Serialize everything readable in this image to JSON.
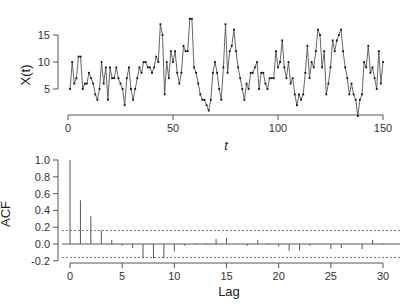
{
  "chart_data": [
    {
      "type": "line",
      "title": "",
      "xlabel": "t",
      "ylabel": "X(t)",
      "xlim": [
        0,
        150
      ],
      "ylim": [
        0,
        18
      ],
      "xticks": [
        0,
        50,
        100,
        150
      ],
      "yticks": [
        5,
        10,
        15
      ],
      "grid": false,
      "markers": true,
      "x": [
        1,
        2,
        3,
        4,
        5,
        6,
        7,
        8,
        9,
        10,
        11,
        12,
        13,
        14,
        15,
        16,
        17,
        18,
        19,
        20,
        21,
        22,
        23,
        24,
        25,
        26,
        27,
        28,
        29,
        30,
        31,
        32,
        33,
        34,
        35,
        36,
        37,
        38,
        39,
        40,
        41,
        42,
        43,
        44,
        45,
        46,
        47,
        48,
        49,
        50,
        51,
        52,
        53,
        54,
        55,
        56,
        57,
        58,
        59,
        60,
        61,
        62,
        63,
        64,
        65,
        66,
        67,
        68,
        69,
        70,
        71,
        72,
        73,
        74,
        75,
        76,
        77,
        78,
        79,
        80,
        81,
        82,
        83,
        84,
        85,
        86,
        87,
        88,
        89,
        90,
        91,
        92,
        93,
        94,
        95,
        96,
        97,
        98,
        99,
        100,
        101,
        102,
        103,
        104,
        105,
        106,
        107,
        108,
        109,
        110,
        111,
        112,
        113,
        114,
        115,
        116,
        117,
        118,
        119,
        120,
        121,
        122,
        123,
        124,
        125,
        126,
        127,
        128,
        129,
        130,
        131,
        132,
        133,
        134,
        135,
        136,
        137,
        138,
        139,
        140,
        141,
        142,
        143,
        144,
        145,
        146,
        147,
        148,
        149,
        150
      ],
      "values": [
        5,
        10,
        6,
        7,
        11,
        11,
        5,
        6,
        6,
        8,
        7,
        6,
        4,
        3,
        5,
        10,
        6,
        9,
        3,
        9,
        7,
        7,
        9,
        7,
        6,
        5,
        2,
        7,
        9,
        5,
        3,
        5,
        7,
        9,
        8,
        10,
        10,
        9,
        9,
        8,
        9,
        11,
        10,
        17,
        15,
        4,
        10,
        7,
        12,
        10,
        12,
        8,
        6,
        8,
        13,
        12,
        12,
        18,
        18,
        9,
        8,
        6,
        4,
        3,
        3,
        2,
        1,
        3,
        8,
        10,
        8,
        5,
        3,
        9,
        17,
        8,
        12,
        13,
        16,
        12,
        9,
        7,
        5,
        3,
        6,
        5,
        8,
        8,
        9,
        10,
        5,
        8,
        8,
        6,
        5,
        7,
        7,
        7,
        12,
        9,
        10,
        14,
        9,
        7,
        10,
        6,
        7,
        4,
        2,
        4,
        3,
        4,
        8,
        13,
        7,
        10,
        9,
        12,
        16,
        15,
        9,
        12,
        4,
        6,
        9,
        14,
        12,
        14,
        15,
        16,
        12,
        9,
        7,
        4,
        6,
        4,
        3,
        0,
        3,
        4,
        10,
        9,
        13,
        8,
        9,
        7,
        5,
        12,
        6,
        10
      ]
    },
    {
      "type": "bar",
      "title": "",
      "xlabel": "Lag",
      "ylabel": "ACF",
      "xlim": [
        0,
        30
      ],
      "ylim": [
        -0.2,
        1.0
      ],
      "xticks": [
        0,
        5,
        10,
        15,
        20,
        25,
        30
      ],
      "yticks": [
        -0.2,
        0.0,
        0.2,
        0.4,
        0.6,
        0.8,
        1.0
      ],
      "confidence_band": [
        -0.16,
        0.16
      ],
      "categories": [
        0,
        1,
        2,
        3,
        4,
        5,
        6,
        7,
        8,
        9,
        10,
        11,
        12,
        13,
        14,
        15,
        16,
        17,
        18,
        19,
        20,
        21,
        22,
        23,
        24,
        25,
        26,
        27,
        28,
        29,
        30,
        31
      ],
      "values": [
        1.0,
        0.52,
        0.33,
        0.16,
        0.05,
        -0.02,
        -0.05,
        -0.17,
        -0.17,
        -0.17,
        -0.09,
        -0.02,
        0.01,
        -0.01,
        0.06,
        0.07,
        0.0,
        -0.02,
        0.05,
        -0.01,
        -0.03,
        -0.08,
        -0.08,
        -0.02,
        0.0,
        -0.06,
        -0.05,
        0.0,
        -0.06,
        0.05,
        -0.01,
        0.0
      ]
    }
  ],
  "top_plot": {
    "ylabel": "X(t)",
    "xlabel": "t",
    "xtick_labels": [
      "0",
      "50",
      "100",
      "150"
    ],
    "ytick_labels": [
      "5",
      "10",
      "15"
    ]
  },
  "bottom_plot": {
    "ylabel": "ACF",
    "xlabel": "Lag",
    "xtick_labels": [
      "0",
      "5",
      "10",
      "15",
      "20",
      "25",
      "30"
    ],
    "ytick_labels": [
      "1.0",
      "0.8",
      "0.6",
      "0.4",
      "0.2",
      "0.0",
      "-0.2"
    ]
  },
  "colors": {
    "line": "#555555",
    "marker": "#111111",
    "axis": "#555555",
    "bar": "#555555",
    "band": "#555555"
  }
}
